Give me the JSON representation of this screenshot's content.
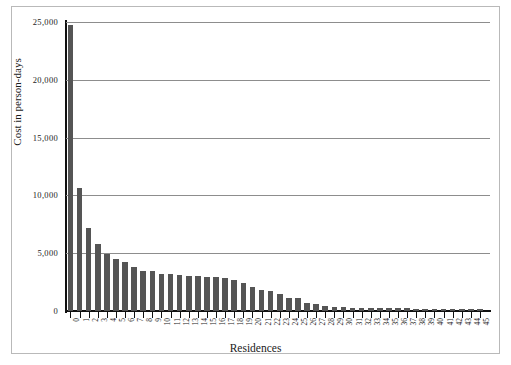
{
  "chart_data": {
    "type": "bar",
    "title": "",
    "xlabel": "Residences",
    "ylabel": "Cost in person-days",
    "categories": [
      "0",
      "1",
      "2",
      "3",
      "4",
      "5",
      "6",
      "7",
      "8",
      "9",
      "10",
      "11",
      "12",
      "13",
      "14",
      "15",
      "16",
      "17",
      "18",
      "19",
      "20",
      "21",
      "22",
      "23",
      "24",
      "25",
      "26",
      "27",
      "28",
      "29",
      "30",
      "31",
      "32",
      "33",
      "34",
      "35",
      "36",
      "37",
      "38",
      "39",
      "40",
      "41",
      "42",
      "43",
      "44",
      "45"
    ],
    "values": [
      24700,
      10600,
      7200,
      5800,
      4950,
      4500,
      4250,
      3850,
      3500,
      3450,
      3200,
      3200,
      3100,
      3050,
      3000,
      2900,
      2900,
      2850,
      2700,
      2450,
      2100,
      1850,
      1750,
      1500,
      1150,
      1100,
      700,
      600,
      420,
      380,
      330,
      300,
      280,
      270,
      250,
      240,
      230,
      220,
      210,
      200,
      190,
      180,
      170,
      160,
      150,
      140
    ],
    "ylim": [
      0,
      25000
    ],
    "yticks": [
      0,
      5000,
      10000,
      15000,
      20000,
      25000
    ],
    "ytick_labels": [
      "0",
      "5,000",
      "10,000",
      "15,000",
      "20,000",
      "25,000"
    ],
    "grid": true,
    "legend": false,
    "bar_color": "#555555",
    "gridline_color": "#8d8d8d",
    "axis_color": "#111111",
    "background_color": "#ffffff"
  }
}
